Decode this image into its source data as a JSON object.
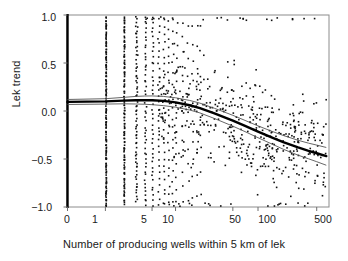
{
  "chart_data": {
    "type": "scatter",
    "title": "",
    "xlabel": "Number of producing wells within 5 km of lek",
    "ylabel": "Lek trend",
    "xscale": "log-like",
    "xlim": [
      0,
      700
    ],
    "ylim": [
      -1.0,
      1.0
    ],
    "grid": false,
    "legend": null,
    "xticks": [
      {
        "label": "0",
        "value": 0
      },
      {
        "label": "1",
        "value": 1
      },
      {
        "label": "5",
        "value": 5
      },
      {
        "label": "10",
        "value": 10
      },
      {
        "label": "50",
        "value": 50
      },
      {
        "label": "100",
        "value": 100
      },
      {
        "label": "500",
        "value": 500
      }
    ],
    "yticks": [
      {
        "label": "1.0",
        "value": 1.0
      },
      {
        "label": "0.5",
        "value": 0.5
      },
      {
        "label": "0.0",
        "value": 0.0
      },
      {
        "label": "−0.5",
        "value": -0.5
      },
      {
        "label": "−1.0",
        "value": -1.0
      }
    ],
    "series": [
      {
        "name": "fitted-trend",
        "type": "line",
        "style": "thick-solid",
        "color": "#000000",
        "points": [
          [
            0,
            0.095
          ],
          [
            1,
            0.1
          ],
          [
            2,
            0.108
          ],
          [
            3,
            0.112
          ],
          [
            4,
            0.113
          ],
          [
            5,
            0.112
          ],
          [
            7,
            0.105
          ],
          [
            10,
            0.09
          ],
          [
            15,
            0.06
          ],
          [
            20,
            0.03
          ],
          [
            30,
            -0.025
          ],
          [
            50,
            -0.1
          ],
          [
            70,
            -0.155
          ],
          [
            100,
            -0.215
          ],
          [
            150,
            -0.28
          ],
          [
            200,
            -0.325
          ],
          [
            300,
            -0.38
          ],
          [
            400,
            -0.415
          ],
          [
            500,
            -0.44
          ],
          [
            650,
            -0.47
          ]
        ]
      },
      {
        "name": "confidence-upper",
        "type": "line",
        "style": "thin-solid",
        "color": "#555555",
        "points": [
          [
            0,
            0.12
          ],
          [
            1,
            0.128
          ],
          [
            2,
            0.142
          ],
          [
            3,
            0.152
          ],
          [
            4,
            0.156
          ],
          [
            5,
            0.157
          ],
          [
            7,
            0.152
          ],
          [
            10,
            0.138
          ],
          [
            15,
            0.11
          ],
          [
            20,
            0.082
          ],
          [
            30,
            0.028
          ],
          [
            50,
            -0.045
          ],
          [
            70,
            -0.098
          ],
          [
            100,
            -0.155
          ],
          [
            150,
            -0.215
          ],
          [
            200,
            -0.255
          ],
          [
            300,
            -0.305
          ],
          [
            400,
            -0.335
          ],
          [
            500,
            -0.355
          ],
          [
            650,
            -0.38
          ]
        ]
      },
      {
        "name": "confidence-lower",
        "type": "line",
        "style": "thin-solid",
        "color": "#555555",
        "points": [
          [
            0,
            0.068
          ],
          [
            1,
            0.072
          ],
          [
            2,
            0.075
          ],
          [
            3,
            0.073
          ],
          [
            4,
            0.07
          ],
          [
            5,
            0.066
          ],
          [
            7,
            0.056
          ],
          [
            10,
            0.04
          ],
          [
            15,
            0.01
          ],
          [
            20,
            -0.02
          ],
          [
            30,
            -0.078
          ],
          [
            50,
            -0.158
          ],
          [
            70,
            -0.215
          ],
          [
            100,
            -0.278
          ],
          [
            150,
            -0.348
          ],
          [
            200,
            -0.398
          ],
          [
            300,
            -0.46
          ],
          [
            400,
            -0.498
          ],
          [
            500,
            -0.528
          ],
          [
            650,
            -0.565
          ]
        ]
      }
    ],
    "scatter_description": "Dense vertical stripes of observations at small integer well counts (1, 2, 3, 4) spanning the full lek-trend range, becoming a diffuse cloud at larger counts; values span -1.0 to 1.0.",
    "scatter_marker": {
      "shape": "square",
      "size": 1.6,
      "color": "#111111"
    },
    "n_points_approx": 1100
  },
  "axis": {
    "spine_left_width": 2.2,
    "frame_color": "#808080"
  }
}
